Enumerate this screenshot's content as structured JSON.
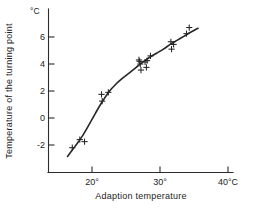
{
  "chart_data": {
    "type": "scatter",
    "title": "",
    "xlabel": "Adaption temperature",
    "ylabel": "Temperature of the turning point",
    "x_unit": "°C",
    "y_unit": "°C",
    "xlim": [
      14.5,
      41.5
    ],
    "ylim": [
      -3.6,
      7.4
    ],
    "grid": false,
    "legend": null,
    "xticks": [
      20,
      30,
      40
    ],
    "xticklabels": [
      "20°",
      "30°",
      "40°C"
    ],
    "yticks": [
      -2,
      0,
      2,
      4,
      6
    ],
    "yticklabels": [
      "-2",
      "0",
      "2",
      "4",
      "6"
    ],
    "points": [
      {
        "x": 17.1,
        "y": -2.2
      },
      {
        "x": 18.2,
        "y": -1.6
      },
      {
        "x": 18.9,
        "y": -1.75
      },
      {
        "x": 21.4,
        "y": 1.75
      },
      {
        "x": 21.5,
        "y": 1.25
      },
      {
        "x": 22.4,
        "y": 1.9
      },
      {
        "x": 26.9,
        "y": 4.3
      },
      {
        "x": 27.0,
        "y": 4.2
      },
      {
        "x": 27.1,
        "y": 4.0
      },
      {
        "x": 27.2,
        "y": 3.55
      },
      {
        "x": 27.8,
        "y": 4.15
      },
      {
        "x": 28.0,
        "y": 3.75
      },
      {
        "x": 28.1,
        "y": 4.25
      },
      {
        "x": 28.6,
        "y": 4.6
      },
      {
        "x": 31.6,
        "y": 5.65
      },
      {
        "x": 31.7,
        "y": 5.1
      },
      {
        "x": 32.0,
        "y": 5.45
      },
      {
        "x": 33.9,
        "y": 6.25
      },
      {
        "x": 34.3,
        "y": 6.7
      }
    ],
    "fit_curve": [
      {
        "x": 16.4,
        "y": -2.85
      },
      {
        "x": 17.5,
        "y": -2.1
      },
      {
        "x": 18.5,
        "y": -1.4
      },
      {
        "x": 19.5,
        "y": -0.55
      },
      {
        "x": 20.5,
        "y": 0.35
      },
      {
        "x": 21.5,
        "y": 1.2
      },
      {
        "x": 22.5,
        "y": 1.95
      },
      {
        "x": 23.5,
        "y": 2.5
      },
      {
        "x": 24.5,
        "y": 2.95
      },
      {
        "x": 25.5,
        "y": 3.35
      },
      {
        "x": 26.5,
        "y": 3.75
      },
      {
        "x": 27.5,
        "y": 4.15
      },
      {
        "x": 28.5,
        "y": 4.5
      },
      {
        "x": 29.5,
        "y": 4.8
      },
      {
        "x": 30.5,
        "y": 5.1
      },
      {
        "x": 31.5,
        "y": 5.45
      },
      {
        "x": 32.5,
        "y": 5.75
      },
      {
        "x": 33.5,
        "y": 6.05
      },
      {
        "x": 34.5,
        "y": 6.35
      },
      {
        "x": 35.6,
        "y": 6.65
      }
    ]
  },
  "axes": {
    "y_unit_label": "°C",
    "y_title": "Temperature of the turning point",
    "x_title": "Adaption temperature",
    "x_tick_labels": [
      "20°",
      "30°",
      "40°C"
    ],
    "y_tick_labels": [
      "6",
      "4",
      "2",
      "0",
      "-2"
    ]
  }
}
